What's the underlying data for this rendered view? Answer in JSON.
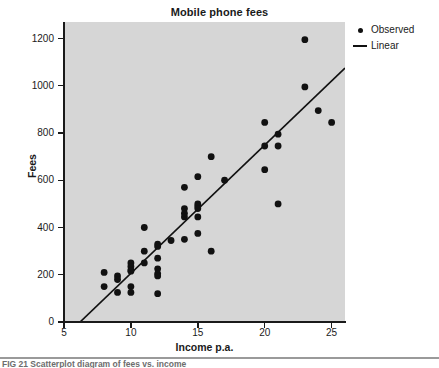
{
  "figure": {
    "title": "Mobile phone fees",
    "caption": "FIG 21 Scatterplot diagram of fees vs. income"
  },
  "legend": {
    "position": "top-right",
    "items": [
      {
        "label": "Observed",
        "key": "dot-marker"
      },
      {
        "label": "Linear",
        "key": "line-marker"
      }
    ]
  },
  "axes": {
    "y_title": "Fees",
    "x_title": "Income p.a.",
    "y_ticks": [
      "0",
      "200",
      "400",
      "600",
      "800",
      "1000",
      "1200"
    ],
    "x_ticks": [
      "5",
      "10",
      "15",
      "20",
      "25"
    ]
  },
  "colors": {
    "panel_background": "#d6d6d6",
    "marker": "#111111",
    "line": "#111111",
    "axis": "#1a1a1a",
    "page_background": "#ffffff"
  },
  "chart_data": {
    "type": "scatter",
    "title": "Mobile phone fees",
    "xlabel": "Income p.a.",
    "ylabel": "Fees",
    "xlim": [
      5,
      26
    ],
    "ylim": [
      0,
      1270
    ],
    "xticks": [
      5,
      10,
      15,
      20,
      25
    ],
    "yticks": [
      0,
      200,
      400,
      600,
      800,
      1000,
      1200
    ],
    "grid": false,
    "legend_position": "top-right",
    "series": [
      {
        "name": "Observed",
        "type": "scatter",
        "marker": "filled-circle",
        "points": [
          [
            8,
            210
          ],
          [
            8,
            150
          ],
          [
            9,
            195
          ],
          [
            9,
            180
          ],
          [
            9,
            125
          ],
          [
            10,
            250
          ],
          [
            10,
            235
          ],
          [
            10,
            220
          ],
          [
            10,
            215
          ],
          [
            10,
            150
          ],
          [
            10,
            125
          ],
          [
            11,
            400
          ],
          [
            11,
            300
          ],
          [
            11,
            250
          ],
          [
            12,
            330
          ],
          [
            12,
            320
          ],
          [
            12,
            270
          ],
          [
            12,
            225
          ],
          [
            12,
            205
          ],
          [
            12,
            195
          ],
          [
            12,
            120
          ],
          [
            13,
            345
          ],
          [
            14,
            570
          ],
          [
            14,
            480
          ],
          [
            14,
            460
          ],
          [
            14,
            445
          ],
          [
            14,
            350
          ],
          [
            15,
            615
          ],
          [
            15,
            500
          ],
          [
            15,
            490
          ],
          [
            15,
            480
          ],
          [
            15,
            445
          ],
          [
            15,
            375
          ],
          [
            16,
            700
          ],
          [
            16,
            300
          ],
          [
            17,
            600
          ],
          [
            20,
            845
          ],
          [
            20,
            745
          ],
          [
            20,
            645
          ],
          [
            21,
            795
          ],
          [
            21,
            745
          ],
          [
            21,
            500
          ],
          [
            23,
            1195
          ],
          [
            23,
            995
          ],
          [
            24,
            895
          ],
          [
            25,
            845
          ]
        ]
      },
      {
        "name": "Linear",
        "type": "line",
        "fit": "linear-regression",
        "endpoints": [
          [
            6.2,
            0
          ],
          [
            26,
            1075
          ]
        ]
      }
    ]
  }
}
